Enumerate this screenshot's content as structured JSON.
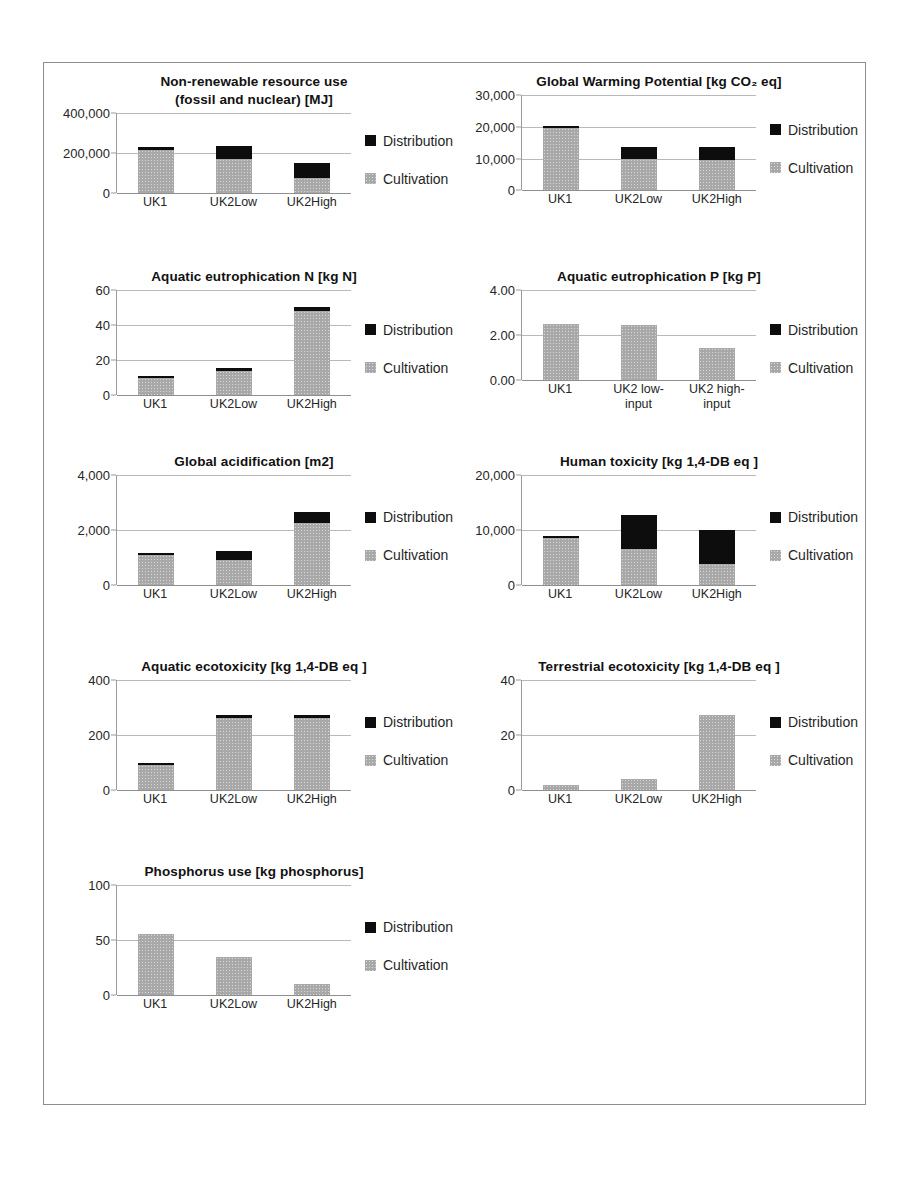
{
  "figure": {
    "colors": {
      "distribution": "#0d0d0d",
      "cultivation": "#a8a8a8",
      "gridline": "#b9b9b9",
      "axis": "#8f8f8f",
      "frame": "#8d8d8d"
    },
    "legend": {
      "distribution_label": "Distribution",
      "cultivation_label": "Cultivation"
    }
  },
  "chart_data": [
    {
      "id": "non-renewable-resource-use",
      "type": "bar",
      "stacked": true,
      "title": "Non-renewable resource use\n(fossil and nuclear) [MJ]",
      "xlabel": "",
      "ylabel": "",
      "ylim": [
        0,
        400000
      ],
      "yticks": [
        0,
        200000,
        400000
      ],
      "ytick_labels": [
        "0",
        "200,000",
        "400,000"
      ],
      "grid": true,
      "legend_position": "right",
      "categories": [
        "UK1",
        "UK2Low",
        "UK2High"
      ],
      "series": [
        {
          "name": "Cultivation",
          "values": [
            215000,
            170000,
            78000
          ]
        },
        {
          "name": "Distribution",
          "values": [
            15000,
            65000,
            72000
          ]
        }
      ]
    },
    {
      "id": "global-warming-potential",
      "type": "bar",
      "stacked": true,
      "title": "Global Warming Potential [kg CO₂ eq]",
      "xlabel": "",
      "ylabel": "",
      "ylim": [
        0,
        30000
      ],
      "yticks": [
        0,
        10000,
        20000,
        30000
      ],
      "ytick_labels": [
        "0",
        "10,000",
        "20,000",
        "30,000"
      ],
      "grid": true,
      "legend_position": "right",
      "categories": [
        "UK1",
        "UK2Low",
        "UK2High"
      ],
      "series": [
        {
          "name": "Cultivation",
          "values": [
            19600,
            9800,
            9700
          ]
        },
        {
          "name": "Distribution",
          "values": [
            600,
            4000,
            4100
          ]
        }
      ]
    },
    {
      "id": "aquatic-eutrophication-n",
      "type": "bar",
      "stacked": true,
      "title": "Aquatic eutrophication N [kg N]",
      "xlabel": "",
      "ylabel": "",
      "ylim": [
        0,
        60
      ],
      "yticks": [
        0,
        20,
        40,
        60
      ],
      "ytick_labels": [
        "0",
        "20",
        "40",
        "60"
      ],
      "grid": true,
      "legend_position": "right",
      "categories": [
        "UK1",
        "UK2Low",
        "UK2High"
      ],
      "series": [
        {
          "name": "Cultivation",
          "values": [
            10,
            14,
            48
          ]
        },
        {
          "name": "Distribution",
          "values": [
            0.3,
            1.8,
            2.5
          ]
        }
      ]
    },
    {
      "id": "aquatic-eutrophication-p",
      "type": "bar",
      "stacked": true,
      "title": "Aquatic eutrophication P [kg P]",
      "xlabel": "",
      "ylabel": "",
      "ylim": [
        0,
        4
      ],
      "yticks": [
        0,
        2,
        4
      ],
      "ytick_labels": [
        "0.00",
        "2.00",
        "4.00"
      ],
      "grid": true,
      "legend_position": "right",
      "categories": [
        "UK1",
        "UK2 low-\ninput",
        "UK2 high-\ninput"
      ],
      "series": [
        {
          "name": "Cultivation",
          "values": [
            2.5,
            2.45,
            1.45
          ]
        },
        {
          "name": "Distribution",
          "values": [
            0,
            0,
            0
          ]
        }
      ]
    },
    {
      "id": "global-acidification",
      "type": "bar",
      "stacked": true,
      "title": "Global acidification [m2]",
      "xlabel": "",
      "ylabel": "",
      "ylim": [
        0,
        4000
      ],
      "yticks": [
        0,
        2000,
        4000
      ],
      "ytick_labels": [
        "0",
        "2,000",
        "4,000"
      ],
      "grid": true,
      "legend_position": "right",
      "categories": [
        "UK1",
        "UK2Low",
        "UK2High"
      ],
      "series": [
        {
          "name": "Cultivation",
          "values": [
            1100,
            900,
            2250
          ]
        },
        {
          "name": "Distribution",
          "values": [
            80,
            350,
            400
          ]
        }
      ]
    },
    {
      "id": "human-toxicity",
      "type": "bar",
      "stacked": true,
      "title": "Human toxicity [kg 1,4-DB eq ]",
      "xlabel": "",
      "ylabel": "",
      "ylim": [
        0,
        20000
      ],
      "yticks": [
        0,
        10000,
        20000
      ],
      "ytick_labels": [
        "0",
        "10,000",
        "20,000"
      ],
      "grid": true,
      "legend_position": "right",
      "categories": [
        "UK1",
        "UK2Low",
        "UK2High"
      ],
      "series": [
        {
          "name": "Cultivation",
          "values": [
            8500,
            6500,
            3800
          ]
        },
        {
          "name": "Distribution",
          "values": [
            100,
            6300,
            6300
          ]
        }
      ]
    },
    {
      "id": "aquatic-ecotoxicity",
      "type": "bar",
      "stacked": true,
      "title": "Aquatic ecotoxicity [kg 1,4-DB eq ]",
      "xlabel": "",
      "ylabel": "",
      "ylim": [
        0,
        400
      ],
      "yticks": [
        0,
        200,
        400
      ],
      "ytick_labels": [
        "0",
        "200",
        "400"
      ],
      "grid": true,
      "legend_position": "right",
      "categories": [
        "UK1",
        "UK2Low",
        "UK2High"
      ],
      "series": [
        {
          "name": "Cultivation",
          "values": [
            92,
            262,
            263
          ]
        },
        {
          "name": "Distribution",
          "values": [
            6,
            12,
            12
          ]
        }
      ]
    },
    {
      "id": "terrestrial-ecotoxicity",
      "type": "bar",
      "stacked": true,
      "title": "Terrestrial ecotoxicity [kg 1,4-DB eq ]",
      "xlabel": "",
      "ylabel": "",
      "ylim": [
        0,
        40
      ],
      "yticks": [
        0,
        20,
        40
      ],
      "ytick_labels": [
        "0",
        "20",
        "40"
      ],
      "grid": true,
      "legend_position": "right",
      "categories": [
        "UK1",
        "UK2Low",
        "UK2High"
      ],
      "series": [
        {
          "name": "Cultivation",
          "values": [
            2,
            4,
            27.5
          ]
        },
        {
          "name": "Distribution",
          "values": [
            0,
            0,
            0
          ]
        }
      ]
    },
    {
      "id": "phosphorus-use",
      "type": "bar",
      "stacked": true,
      "title": "Phosphorus use [kg phosphorus]",
      "xlabel": "",
      "ylabel": "",
      "ylim": [
        0,
        100
      ],
      "yticks": [
        0,
        50,
        100
      ],
      "ytick_labels": [
        "0",
        "50",
        "100"
      ],
      "grid": true,
      "legend_position": "right",
      "categories": [
        "UK1",
        "UK2Low",
        "UK2High"
      ],
      "series": [
        {
          "name": "Cultivation",
          "values": [
            56,
            35,
            10
          ]
        },
        {
          "name": "Distribution",
          "values": [
            0,
            0,
            0
          ]
        }
      ]
    }
  ]
}
